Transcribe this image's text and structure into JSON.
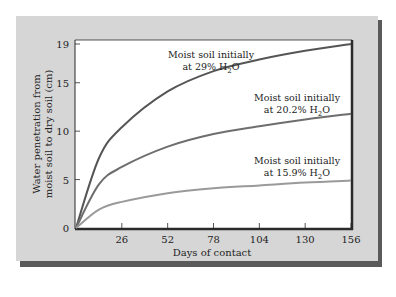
{
  "chart_data": {
    "type": "line",
    "title": "",
    "xlabel": "Days of contact",
    "ylabel_line1": "Water penetration from",
    "ylabel_line2": "moist soil to dry soil (cm)",
    "xlim": [
      0,
      156
    ],
    "ylim": [
      0,
      19
    ],
    "x_ticks": [
      0,
      26,
      52,
      78,
      104,
      130,
      156
    ],
    "x_tick_labels": [
      "26",
      "52",
      "78",
      "104",
      "130",
      "156"
    ],
    "y_ticks": [
      0,
      5,
      10,
      15,
      19
    ],
    "y_tick_labels": [
      "0",
      "5",
      "10",
      "15",
      "19"
    ],
    "grid": false,
    "legend": "inline annotations",
    "x": [
      0,
      13,
      26,
      52,
      78,
      104,
      130,
      156
    ],
    "series": [
      {
        "name": "Moist soil initially at 29% H2O",
        "label_line1": "Moist soil initially",
        "label_line2_prefix": "at 29% H",
        "label_sub": "2",
        "label_line2_suffix": "O",
        "color": "#555555",
        "values": [
          0,
          7.2,
          10.4,
          14.1,
          16.2,
          17.4,
          18.3,
          19.0
        ]
      },
      {
        "name": "Moist soil initially at 20.2% H2O",
        "label_line1": "Moist soil initially",
        "label_line2_prefix": "at 20.2% H",
        "label_sub": "2",
        "label_line2_suffix": "O",
        "color": "#6e6e6e",
        "values": [
          0,
          4.5,
          6.3,
          8.4,
          9.7,
          10.5,
          11.2,
          11.8
        ]
      },
      {
        "name": "Moist soil initially at 15.9% H2O",
        "label_line1": "Moist soil initially",
        "label_line2_prefix": "at 15.9% H",
        "label_sub": "2",
        "label_line2_suffix": "O",
        "color": "#9a9a9a",
        "values": [
          0,
          1.9,
          2.7,
          3.6,
          4.1,
          4.4,
          4.7,
          4.9
        ]
      }
    ]
  },
  "colors": {
    "panel": "#d6d6d6",
    "panel_shadow": "#5a5a5a",
    "plot_bg": "#ffffff",
    "axis": "#2a2a2a"
  }
}
